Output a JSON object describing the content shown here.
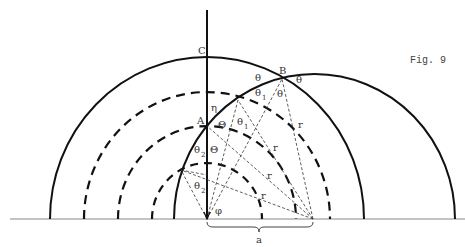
{
  "figure": {
    "caption": "Fig. 9",
    "colors": {
      "ink": "#111111",
      "baseline": "#888888",
      "label": "#333333"
    }
  },
  "labels": {
    "C": "C",
    "B": "B",
    "A": "A",
    "eta": "η",
    "Theta_A": "Θ",
    "Theta_low": "Θ",
    "theta_top_left": "θ",
    "theta_top_right": "θ",
    "theta_B": "θ",
    "theta1_upper": "θ",
    "theta1_upper_sub": "1",
    "theta1_lower": "θ",
    "theta1_lower_sub": "1",
    "theta2_upper": "θ",
    "theta2_upper_sub": "2",
    "theta2_lower": "θ",
    "theta2_lower_sub": "2",
    "phi": "φ",
    "r1": "r",
    "r2": "r",
    "r3": "r",
    "r4": "r",
    "a": "a"
  }
}
